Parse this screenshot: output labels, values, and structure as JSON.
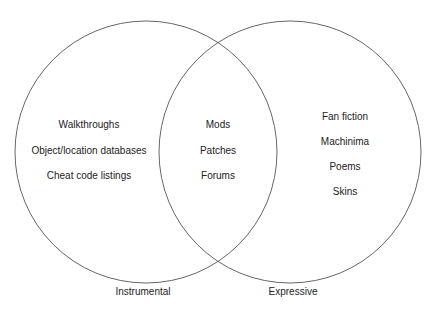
{
  "diagram": {
    "type": "venn",
    "sets": [
      {
        "label": "Instrumental",
        "items": [
          "Walkthroughs",
          "Object/location databases",
          "Cheat code listings"
        ]
      },
      {
        "label": "Expressive",
        "items": [
          "Fan fiction",
          "Machinima",
          "Poems",
          "Skins"
        ]
      }
    ],
    "intersection": {
      "items": [
        "Mods",
        "Patches",
        "Forums"
      ]
    },
    "stroke_color": "#555555"
  },
  "left": {
    "label": "Instrumental",
    "items": [
      "Walkthroughs",
      "Object/location databases",
      "Cheat code listings"
    ]
  },
  "middle": {
    "items": [
      "Mods",
      "Patches",
      "Forums"
    ]
  },
  "right": {
    "label": "Expressive",
    "items": [
      "Fan fiction",
      "Machinima",
      "Poems",
      "Skins"
    ]
  }
}
